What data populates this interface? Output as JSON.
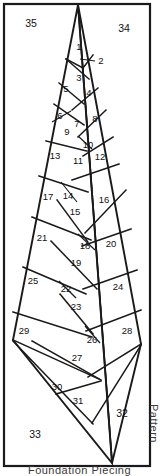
{
  "document": {
    "title": "Leaf Foundation Piecing Pattern",
    "caption_bottom": "Foundation Piecing",
    "caption_side": "Pattern"
  },
  "frame": {
    "border_color": "#1a1a1a",
    "background_color": "#ffffff"
  },
  "pattern": {
    "type": "foundation-piecing-leaf",
    "piece_count": 35,
    "line_color": "#1a1a1a",
    "pieces": [
      {
        "id": "1",
        "label": "1",
        "x": 79,
        "y": 47
      },
      {
        "id": "2",
        "label": "2",
        "x": 101,
        "y": 61,
        "leader": true,
        "leader_from_x": 95,
        "leader_from_y": 61,
        "leader_to_x": 80,
        "leader_to_y": 59
      },
      {
        "id": "3",
        "label": "3",
        "x": 79,
        "y": 75
      },
      {
        "id": "4",
        "label": "4",
        "x": 88,
        "y": 92
      },
      {
        "id": "5",
        "label": "5",
        "x": 66,
        "y": 88
      },
      {
        "id": "6",
        "label": "6",
        "x": 60,
        "y": 115
      },
      {
        "id": "7",
        "label": "7",
        "x": 77,
        "y": 123
      },
      {
        "id": "8",
        "label": "8",
        "x": 95,
        "y": 118
      },
      {
        "id": "9",
        "label": "9",
        "x": 67,
        "y": 131
      },
      {
        "id": "10",
        "label": "10",
        "x": 87,
        "y": 144
      },
      {
        "id": "11",
        "label": "11",
        "x": 78,
        "y": 160
      },
      {
        "id": "12",
        "label": "12",
        "x": 99,
        "y": 156
      },
      {
        "id": "13",
        "label": "13",
        "x": 55,
        "y": 155
      },
      {
        "id": "14",
        "label": "14",
        "x": 68,
        "y": 195
      },
      {
        "id": "15",
        "label": "15",
        "x": 75,
        "y": 211
      },
      {
        "id": "16",
        "label": "16",
        "x": 103,
        "y": 199
      },
      {
        "id": "17",
        "label": "17",
        "x": 48,
        "y": 196
      },
      {
        "id": "18",
        "label": "18",
        "x": 84,
        "y": 245
      },
      {
        "id": "19",
        "label": "19",
        "x": 76,
        "y": 262
      },
      {
        "id": "20",
        "label": "20",
        "x": 110,
        "y": 243
      },
      {
        "id": "21",
        "label": "21",
        "x": 42,
        "y": 237
      },
      {
        "id": "22",
        "label": "22",
        "x": 66,
        "y": 288
      },
      {
        "id": "23",
        "label": "23",
        "x": 76,
        "y": 306
      },
      {
        "id": "24",
        "label": "24",
        "x": 117,
        "y": 286
      },
      {
        "id": "25",
        "label": "25",
        "x": 33,
        "y": 280
      },
      {
        "id": "26",
        "label": "26",
        "x": 91,
        "y": 339
      },
      {
        "id": "27",
        "label": "27",
        "x": 77,
        "y": 357
      },
      {
        "id": "28",
        "label": "28",
        "x": 126,
        "y": 330
      },
      {
        "id": "29",
        "label": "29",
        "x": 23,
        "y": 330
      },
      {
        "id": "30",
        "label": "30",
        "x": 57,
        "y": 386
      },
      {
        "id": "31",
        "label": "31",
        "x": 78,
        "y": 400
      },
      {
        "id": "32",
        "label": "32",
        "x": 122,
        "y": 413
      },
      {
        "id": "33",
        "label": "33",
        "x": 35,
        "y": 434
      },
      {
        "id": "34",
        "label": "34",
        "x": 124,
        "y": 28
      },
      {
        "id": "35",
        "label": "35",
        "x": 31,
        "y": 23
      }
    ]
  }
}
